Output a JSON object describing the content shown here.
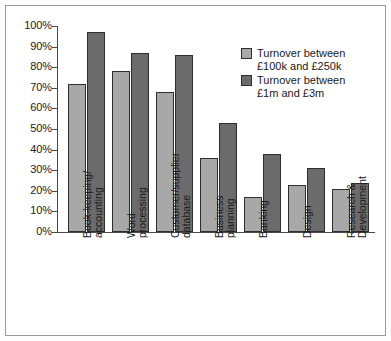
{
  "chart_data": {
    "type": "bar",
    "title": "",
    "subtitle": "",
    "xlabel": "",
    "ylabel": "",
    "ylim": [
      0,
      100
    ],
    "grid": false,
    "legend_position": "top-right",
    "y_tick_labels": [
      "100%",
      "90%",
      "80%",
      "70%",
      "60%",
      "50%",
      "40%",
      "30%",
      "20%",
      "10%",
      "0%"
    ],
    "y_tick_values": [
      100,
      90,
      80,
      70,
      60,
      50,
      40,
      30,
      20,
      10,
      0
    ],
    "categories": [
      "Book-keeping/\naccounting",
      "Word\nprocessing",
      "Customer/supplier\ndatabase",
      "Business\nplanning",
      "Banking",
      "Design",
      "Research &\nDevelopment"
    ],
    "series": [
      {
        "name": "Turnover between\n£100k and £250k",
        "color": "#a8a8a8",
        "values": [
          72,
          78,
          68,
          36,
          17,
          23,
          21
        ]
      },
      {
        "name": "Turnover between\n£1m and £3m",
        "color": "#6b6b6b",
        "values": [
          97,
          87,
          86,
          53,
          38,
          31,
          24
        ]
      }
    ]
  },
  "legend": {
    "entries": [
      "Turnover between\n£100k and £250k",
      "Turnover between\n£1m and £3m"
    ]
  },
  "colors": {
    "series_1": "#a8a8a8",
    "series_2": "#6b6b6b",
    "axis": "#4a4a4a",
    "bar_outline": "#2e2e2e",
    "frame": "#9a9a9a",
    "background": "#ffffff"
  }
}
